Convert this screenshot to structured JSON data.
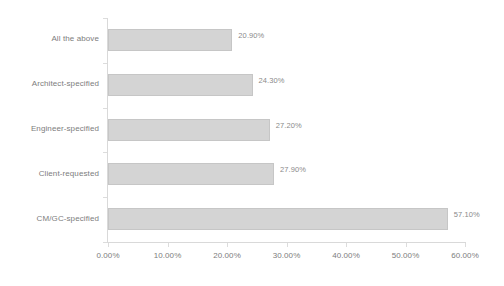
{
  "chart_data": {
    "type": "bar",
    "orientation": "horizontal",
    "title": "",
    "subtitle": "",
    "xlabel": "",
    "ylabel": "",
    "xlim": [
      0,
      60
    ],
    "grid": false,
    "legend": false,
    "legend_position": "none",
    "categories": [
      "All the above",
      "Architect-specified",
      "Engineer-specified",
      "Client-requested",
      "CM/GC-specified"
    ],
    "values": [
      20.9,
      24.3,
      27.2,
      27.9,
      57.1
    ],
    "value_labels": [
      "20.90%",
      "24.30%",
      "27.20%",
      "27.90%",
      "57.10%"
    ],
    "xtick_values": [
      0,
      10,
      20,
      30,
      40,
      50,
      60
    ],
    "xtick_labels": [
      "0.00%",
      "10.00%",
      "20.00%",
      "30.00%",
      "40.00%",
      "50.00%",
      "60.00%"
    ],
    "colors": {
      "bar_fill": "#d4d4d4",
      "bar_border": "#c6c6c6",
      "axis_line": "#d9d9d9",
      "tick_mark": "#dcdcdc",
      "text": "#7d7d7d",
      "value_text": "#8a8a8a",
      "background": "#ffffff"
    }
  }
}
